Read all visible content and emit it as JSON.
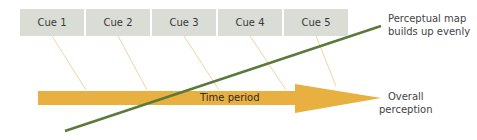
{
  "cues": [
    {
      "label": "Cue 1",
      "x": 20
    },
    {
      "label": "Cue 2",
      "x": 86
    },
    {
      "label": "Cue 3",
      "x": 152
    },
    {
      "label": "Cue 4",
      "x": 218
    },
    {
      "label": "Cue 5",
      "x": 284
    }
  ],
  "arrow_label": "Time period",
  "perceptual_map_label": {
    "line1": "Perceptual map",
    "line2": "builds up evenly"
  },
  "overall_label": {
    "line1": "Overall",
    "line2": "perception"
  },
  "colors": {
    "cue_box": "#d9ddd6",
    "arrow": "#e8b040",
    "connector": "#f0d9a8",
    "trend_line": "#5a7a3a"
  }
}
